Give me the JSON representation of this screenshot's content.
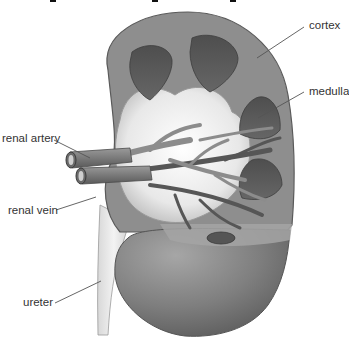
{
  "figure": {
    "title_partially_visible": "",
    "colors": {
      "background": "#ffffff",
      "cortex": "#8c8c8c",
      "cortex_edge": "#5a5a5a",
      "medulla_pyramid": "#555555",
      "pelvis": "#ececec",
      "vessel": "#7a7a7a",
      "vessel_dark": "#4f4f4f",
      "ureter": "#e6e6e6",
      "label_text": "#333333",
      "leader_line": "#555555"
    }
  },
  "labels": {
    "cortex": "cortex",
    "medulla": "medulla",
    "renal_artery": "renal artery",
    "renal_vein": "renal vein",
    "ureter": "ureter"
  }
}
